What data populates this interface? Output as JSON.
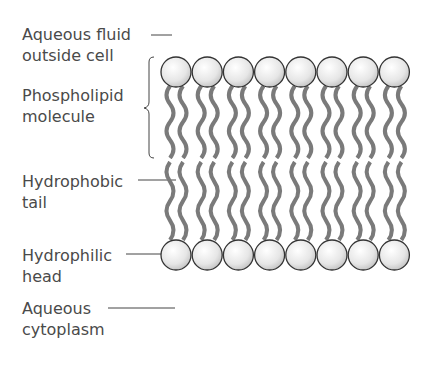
{
  "labels": {
    "aqueous_fluid": "Aqueous fluid\noutside cell",
    "phospholipid": "Phospholipid\nmolecule",
    "hydrophobic": "Hydrophobic\ntail",
    "hydrophilic": "Hydrophilic\nhead",
    "cytoplasm": "Aqueous\ncytoplasm"
  },
  "diagram": {
    "heads_per_layer": 8,
    "head_color": "#eeeeee",
    "head_outline": "#333333",
    "tail_color": "#7a7a7a"
  }
}
